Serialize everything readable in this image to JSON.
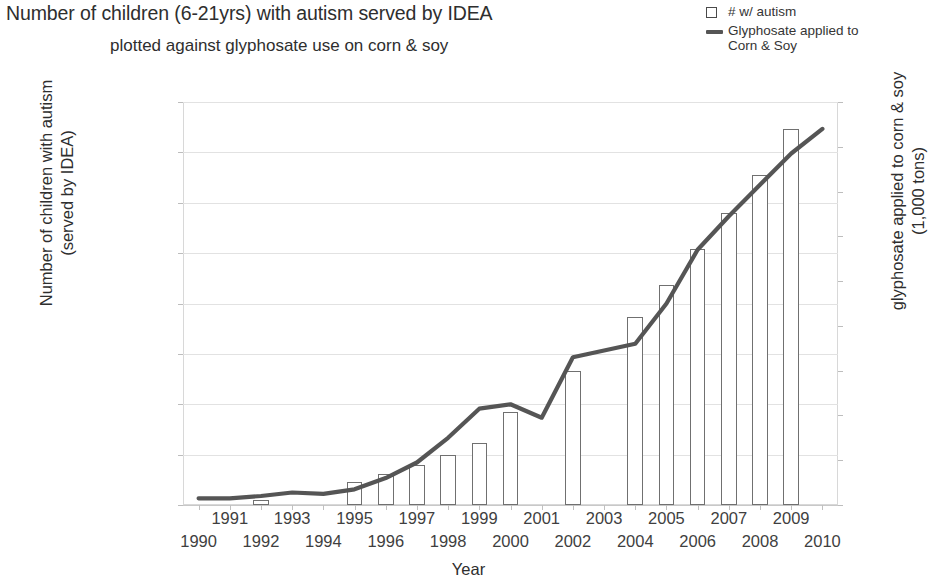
{
  "title": {
    "line1": "Number of children (6-21yrs) with autism served by IDEA",
    "line2": "plotted against glyphosate use on corn & soy"
  },
  "legend": {
    "position": "top-right",
    "items": [
      {
        "label": "# w/ autism",
        "marker": "open-square",
        "color": "#4a4a4a"
      },
      {
        "label": "Glyphosate applied to\nCorn & Soy",
        "marker": "line",
        "color": "#555555"
      }
    ]
  },
  "axes": {
    "y_left_title": "Number of children with autism\n(served by IDEA)",
    "y_right_title": "glyphosate applied to corn & soy\n(1,000 tons)",
    "x_title": "Year",
    "y_left_ticks": [
      "0",
      "50000",
      "100000",
      "150000",
      "200000",
      "250000",
      "300000",
      "350000",
      "400000"
    ],
    "y_right_ticks": [
      "0",
      "10",
      "20",
      "30",
      "40",
      "50",
      "60",
      "70",
      "80",
      "90"
    ],
    "x_ticks": [
      "1990",
      "1991",
      "1992",
      "1993",
      "1994",
      "1995",
      "1996",
      "1997",
      "1998",
      "1999",
      "2000",
      "2001",
      "2002",
      "2003",
      "2004",
      "2005",
      "2006",
      "2007",
      "2008",
      "2009",
      "2010"
    ]
  },
  "chart_data": {
    "type": "bar",
    "title": "Number of children (6-21yrs) with autism served by IDEA plotted against glyphosate use on corn & soy",
    "xlabel": "Year",
    "ylabel": "Number of children with autism (served by IDEA)",
    "y2label": "glyphosate applied to corn & soy (1,000 tons)",
    "ylim": [
      0,
      400000
    ],
    "y2lim": [
      0,
      90
    ],
    "grid": true,
    "legend_position": "top-right",
    "categories": [
      "1990",
      "1991",
      "1992",
      "1993",
      "1994",
      "1995",
      "1996",
      "1997",
      "1998",
      "1999",
      "2000",
      "2001",
      "2002",
      "2003",
      "2004",
      "2005",
      "2006",
      "2007",
      "2008",
      "2009",
      "2010"
    ],
    "series": [
      {
        "name": "# w/ autism",
        "type": "bar",
        "axis": "left",
        "color": "#ffffff",
        "edge_color": "#707070",
        "values": [
          null,
          null,
          5000,
          null,
          null,
          23000,
          31000,
          40000,
          50000,
          62000,
          92000,
          null,
          133000,
          null,
          187000,
          218000,
          254000,
          290000,
          328000,
          373000,
          null
        ]
      },
      {
        "name": "Glyphosate applied to Corn & Soy",
        "type": "line",
        "axis": "right",
        "color": "#555555",
        "values": [
          1.5,
          1.5,
          2.0,
          2.8,
          2.5,
          3.5,
          6.0,
          9.5,
          15.0,
          21.5,
          22.5,
          19.5,
          33.0,
          34.5,
          36.0,
          45.0,
          57.0,
          64.5,
          71.5,
          78.5,
          84.0
        ]
      }
    ]
  }
}
